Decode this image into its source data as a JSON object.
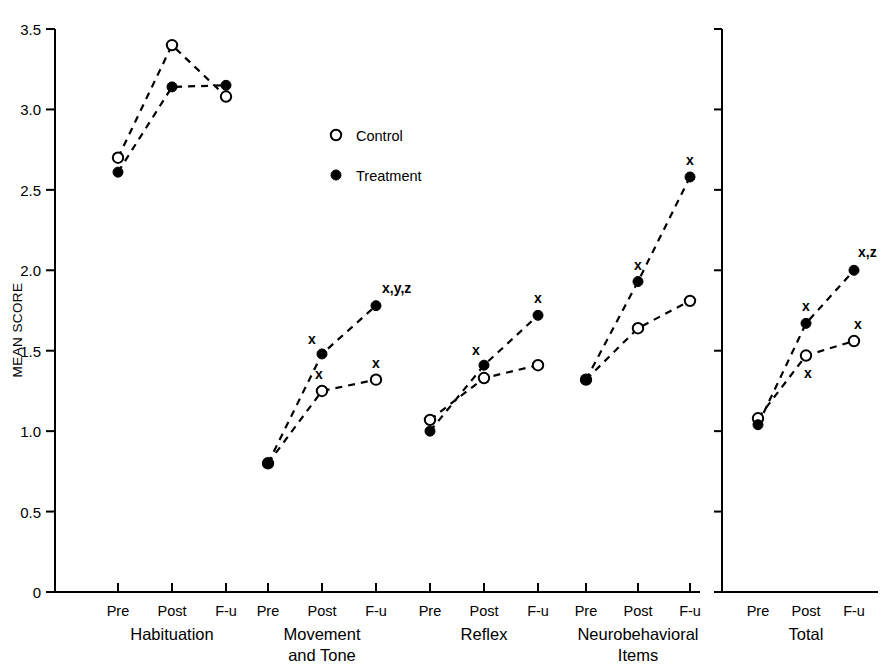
{
  "chart_data": {
    "type": "line",
    "title": "",
    "xlabel": "",
    "ylabel": "MEAN SCORE",
    "ylim": [
      0,
      3.5
    ],
    "ytick_labels": [
      "0",
      "0.5",
      "1.0",
      "1.5",
      "2.0",
      "2.5",
      "3.0",
      "3.5"
    ],
    "ytick_values": [
      0,
      0.5,
      1.0,
      1.5,
      2.0,
      2.5,
      3.0,
      3.5
    ],
    "grid": false,
    "legend_position": "upper-center",
    "legend": [
      {
        "name": "Control",
        "marker": "open-circle"
      },
      {
        "name": "Treatment",
        "marker": "filled-circle"
      }
    ],
    "categories": [
      "Pre",
      "Post",
      "F-u"
    ],
    "panels": [
      {
        "name": "Habituation",
        "label_lines": [
          "Habituation"
        ],
        "series": [
          {
            "name": "Control",
            "marker": "open-circle",
            "values": [
              2.7,
              3.4,
              3.08
            ],
            "annotations": [
              "",
              "",
              ""
            ]
          },
          {
            "name": "Treatment",
            "marker": "filled-circle",
            "values": [
              2.61,
              3.14,
              3.15
            ],
            "annotations": [
              "",
              "",
              ""
            ]
          }
        ]
      },
      {
        "name": "Movement and Tone",
        "label_lines": [
          "Movement",
          "and Tone"
        ],
        "series": [
          {
            "name": "Control",
            "marker": "open-circle",
            "values": [
              0.8,
              1.25,
              1.32
            ],
            "annotations": [
              "",
              "x",
              "x"
            ]
          },
          {
            "name": "Treatment",
            "marker": "filled-circle",
            "values": [
              0.8,
              1.48,
              1.78
            ],
            "annotations": [
              "",
              "x",
              "x,y,z"
            ]
          }
        ]
      },
      {
        "name": "Reflex",
        "label_lines": [
          "Reflex"
        ],
        "series": [
          {
            "name": "Control",
            "marker": "open-circle",
            "values": [
              1.07,
              1.33,
              1.41
            ],
            "annotations": [
              "",
              "",
              ""
            ]
          },
          {
            "name": "Treatment",
            "marker": "filled-circle",
            "values": [
              1.0,
              1.41,
              1.72
            ],
            "annotations": [
              "",
              "x",
              "x"
            ]
          }
        ]
      },
      {
        "name": "Neurobehavioral Items",
        "label_lines": [
          "Neurobehavioral",
          "Items"
        ],
        "series": [
          {
            "name": "Control",
            "marker": "open-circle",
            "values": [
              1.32,
              1.64,
              1.81
            ],
            "annotations": [
              "",
              "",
              ""
            ]
          },
          {
            "name": "Treatment",
            "marker": "filled-circle",
            "values": [
              1.32,
              1.93,
              2.58
            ],
            "annotations": [
              "",
              "x",
              "x"
            ]
          }
        ]
      },
      {
        "name": "Total",
        "label_lines": [
          "Total"
        ],
        "separate_axis": true,
        "series": [
          {
            "name": "Control",
            "marker": "open-circle",
            "values": [
              1.08,
              1.47,
              1.56
            ],
            "annotations": [
              "",
              "x",
              "x"
            ]
          },
          {
            "name": "Treatment",
            "marker": "filled-circle",
            "values": [
              1.04,
              1.67,
              2.0
            ],
            "annotations": [
              "",
              "x",
              "x,z"
            ]
          }
        ]
      }
    ]
  },
  "axis": {
    "y_title": "MEAN SCORE"
  },
  "legend": {
    "control_label": "Control",
    "treatment_label": "Treatment"
  },
  "colors": {
    "ink": "#000000",
    "background": "#ffffff"
  }
}
